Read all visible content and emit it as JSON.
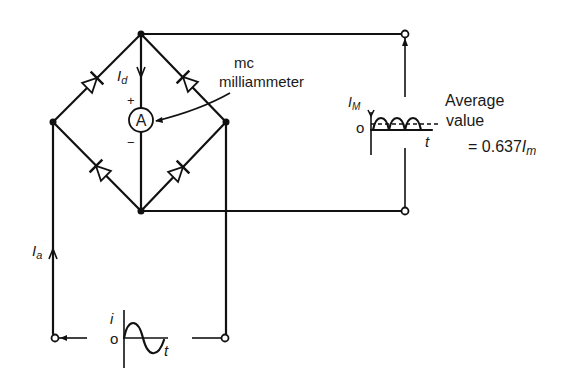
{
  "diagram": {
    "type": "bridge-rectifier-circuit",
    "meter": {
      "symbol": "A",
      "label_line1": "mc",
      "label_line2": "milliammeter",
      "plus": "+",
      "minus": "−"
    },
    "currents": {
      "dc": "I",
      "dc_sub": "d",
      "ac": "I",
      "ac_sub": "a"
    },
    "input_waveform": {
      "y_label": "i",
      "origin": "o",
      "x_label": "t"
    },
    "output_waveform": {
      "y_label": "I",
      "y_sub": "M",
      "origin": "o",
      "x_label": "t"
    },
    "average": {
      "line1": "Average",
      "line2": "value",
      "formula_prefix": "= 0.637",
      "formula_var": "I",
      "formula_sub": "m"
    },
    "colors": {
      "ink": "#111111",
      "background": "#ffffff"
    }
  }
}
